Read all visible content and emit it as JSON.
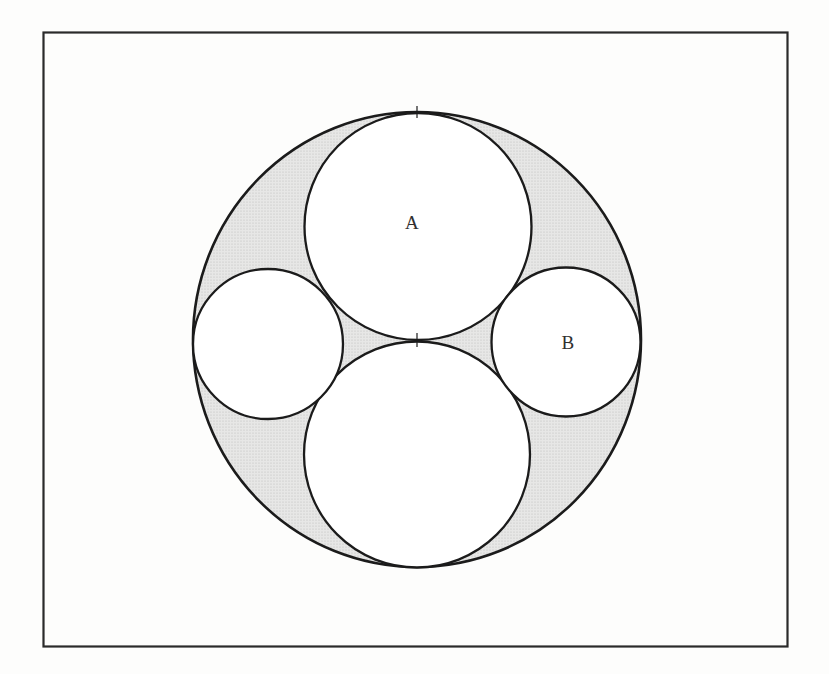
{
  "colors": {
    "page_background": "#fdfdfc",
    "frame_border": "#2a2a2a",
    "circle_stroke": "#1b1b1b",
    "circle_fill": "#ffffff",
    "shade_base": "#e7e7e6",
    "shade_dot": "#bdbdbc",
    "label_color": "#303030"
  },
  "figure": {
    "frame": {
      "x": 43.5,
      "y": 32.5,
      "width": 744,
      "height": 614
    },
    "outer_circle": {
      "cx": 417,
      "cy": 339.5,
      "rx": 224,
      "ry": 227.5
    },
    "inner_circles": [
      {
        "geo": {
          "cx": 418,
          "cy": 226.5,
          "r": 113.5
        }
      },
      {
        "geo": {
          "cx": 417,
          "cy": 454.5,
          "r": 113
        }
      },
      {
        "geo": {
          "cx": 268,
          "cy": 344,
          "r": 75
        }
      },
      {
        "geo": {
          "cx": 566,
          "cy": 342,
          "r": 74.5
        }
      }
    ],
    "labels": [
      {
        "text": "A",
        "pos": {
          "x": 412,
          "y": 229
        }
      },
      {
        "text": "B",
        "pos": {
          "x": 568,
          "y": 349
        }
      }
    ],
    "tangent_ticks": [
      {
        "geo": {
          "x1": 417,
          "y1": 106,
          "x2": 417,
          "y2": 118
        }
      },
      {
        "geo": {
          "x1": 417,
          "y1": 333,
          "x2": 417,
          "y2": 347
        }
      }
    ]
  }
}
